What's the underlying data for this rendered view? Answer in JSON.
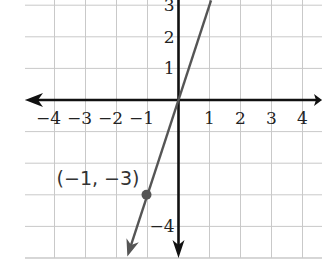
{
  "chart_data": {
    "type": "line",
    "title": "",
    "xlabel": "",
    "ylabel": "",
    "xlim": [
      -5,
      4.5
    ],
    "ylim": [
      -5,
      3.2
    ],
    "grid": true,
    "x_ticks": [
      {
        "value": -4,
        "label": "−4"
      },
      {
        "value": -3,
        "label": "−3"
      },
      {
        "value": -2,
        "label": "−2"
      },
      {
        "value": -1,
        "label": "−1"
      },
      {
        "value": 1,
        "label": "1"
      },
      {
        "value": 2,
        "label": "2"
      },
      {
        "value": 3,
        "label": "3"
      },
      {
        "value": 4,
        "label": "4"
      }
    ],
    "y_ticks": [
      {
        "value": 3,
        "label": "3"
      },
      {
        "value": 2,
        "label": "2"
      },
      {
        "value": 1,
        "label": "1"
      },
      {
        "value": -4,
        "label": "−4"
      }
    ],
    "series": [
      {
        "name": "y = 3x",
        "slope": 3,
        "intercept": 0,
        "x": [
          -1.65,
          1.05
        ],
        "y": [
          -4.95,
          3.15
        ],
        "color": "#555555"
      }
    ],
    "points": [
      {
        "x": -1,
        "y": -3,
        "label": "(−1, −3)",
        "color": "#555555"
      }
    ],
    "legend": "none"
  }
}
